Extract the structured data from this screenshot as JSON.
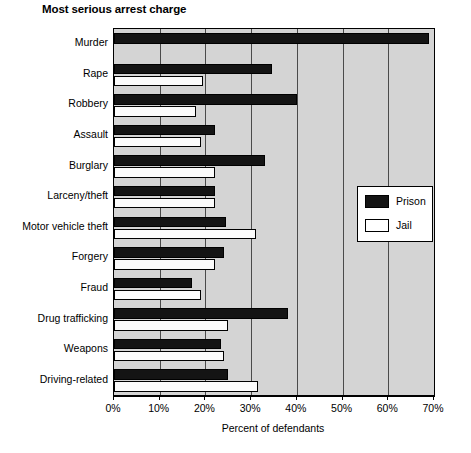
{
  "chart_data": {
    "type": "bar",
    "orientation": "horizontal",
    "title": "Most serious arrest charge",
    "xlabel": "Percent of defendants",
    "ylabel": "",
    "xlim": [
      0,
      70
    ],
    "xticks": [
      0,
      10,
      20,
      30,
      40,
      50,
      60,
      70
    ],
    "xtick_labels": [
      "0%",
      "10%",
      "20%",
      "30%",
      "40%",
      "50%",
      "60%",
      "70%"
    ],
    "grid": true,
    "grid_axis": "x",
    "legend_position": "center right",
    "categories": [
      "Murder",
      "Rape",
      "Robbery",
      "Assault",
      "Burglary",
      "Larceny/theft",
      "Motor vehicle theft",
      "Forgery",
      "Fraud",
      "Drug trafficking",
      "Weapons",
      "Driving-related"
    ],
    "series": [
      {
        "name": "Prison",
        "color": "#141414",
        "values": [
          69,
          34.5,
          40,
          22,
          33,
          22,
          24.5,
          24,
          17,
          38,
          23.5,
          25
        ]
      },
      {
        "name": "Jail",
        "color": "#ffffff",
        "values": [
          0,
          19.5,
          18,
          19,
          22,
          22,
          31,
          22,
          19,
          25,
          24,
          31.5
        ]
      }
    ]
  },
  "legend": {
    "entries": [
      {
        "label": "Prison",
        "swatch": "prison"
      },
      {
        "label": "Jail",
        "swatch": "jail"
      }
    ]
  },
  "colors": {
    "plot_background": "#d4d4d4",
    "prison": "#141414",
    "jail": "#ffffff",
    "axis": "#000000",
    "gridline": "#4a4a4a"
  }
}
